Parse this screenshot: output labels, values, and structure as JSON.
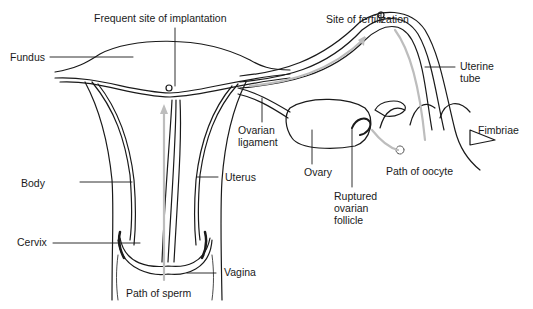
{
  "diagram": {
    "type": "anatomical-illustration",
    "colors": {
      "ink": "#1a1a1a",
      "arrow": "#bdbdbd",
      "background": "#ffffff"
    }
  },
  "labels": {
    "frequent_site": "Frequent site of implantation",
    "site_fertilization": "Site of fertilization",
    "fundus": "Fundus",
    "uterine_tube": "Uterine\ntube",
    "ovarian_ligament": "Ovarian\nligament",
    "fimbriae": "Fimbriae",
    "ovary": "Ovary",
    "path_oocyte": "Path of oocyte",
    "body": "Body",
    "uterus": "Uterus",
    "ruptured_follicle": "Ruptured\novarian\nfollicle",
    "cervix": "Cervix",
    "vagina": "Vagina",
    "path_sperm": "Path of sperm"
  }
}
